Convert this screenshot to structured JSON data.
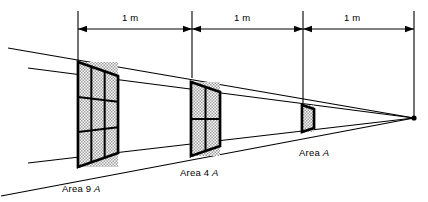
{
  "figure": {
    "name": "inverse-square-law-diagram",
    "background_color": "#ffffff",
    "line_color": "#000000",
    "fill_color": "#cfcfcf",
    "point_source": {
      "x": 414,
      "y": 118,
      "label": ""
    },
    "dimensions": {
      "axis_y": 29,
      "ticks_x": [
        78,
        192,
        303,
        414
      ],
      "tick_tops": [
        11,
        11,
        11,
        11
      ],
      "tick_bottoms": [
        62,
        78,
        103,
        118
      ],
      "segments": [
        {
          "label": "1 m",
          "from_x": 78,
          "to_x": 192,
          "label_x": 122,
          "label_y": 12
        },
        {
          "label": "1 m",
          "from_x": 192,
          "to_x": 303,
          "label_x": 234,
          "label_y": 12
        },
        {
          "label": "1 m",
          "from_x": 303,
          "to_x": 414,
          "label_x": 344,
          "label_y": 12
        }
      ]
    },
    "panels": [
      {
        "name": "panel-9a",
        "grid": 3,
        "front_left_x": 78,
        "front_top_y": 62,
        "front_bottom_y": 167,
        "back_right_x": 118,
        "back_top_y": 76,
        "back_bottom_y": 153,
        "label": "Area 9 ",
        "label_italic": "A",
        "label_x": 62,
        "label_y": 183
      },
      {
        "name": "panel-4a",
        "grid": 2,
        "front_left_x": 191,
        "front_top_y": 82,
        "front_bottom_y": 156,
        "back_right_x": 220,
        "back_top_y": 92,
        "back_bottom_y": 146,
        "label": "Area 4 ",
        "label_italic": "A",
        "label_x": 180,
        "label_y": 167
      },
      {
        "name": "panel-a",
        "grid": 1,
        "front_left_x": 302,
        "front_top_y": 105,
        "front_bottom_y": 132,
        "back_right_x": 314,
        "back_top_y": 109,
        "back_bottom_y": 128,
        "label": "Area ",
        "label_italic": "A",
        "label_x": 299,
        "label_y": 147
      }
    ],
    "rays": [
      {
        "name": "ray-upper-back",
        "x1": 8,
        "y1": 48,
        "x2": 414,
        "y2": 118
      },
      {
        "name": "ray-upper-front",
        "x1": 28,
        "y1": 68,
        "x2": 414,
        "y2": 118
      },
      {
        "name": "ray-lower-front",
        "x1": 28,
        "y1": 163,
        "x2": 414,
        "y2": 118
      },
      {
        "name": "ray-lower-back",
        "x1": 1,
        "y1": 196,
        "x2": 414,
        "y2": 118
      }
    ]
  }
}
